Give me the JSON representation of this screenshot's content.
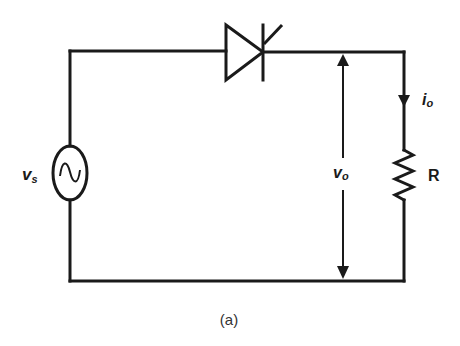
{
  "diagram": {
    "type": "circuit",
    "caption": "(a)",
    "components": {
      "source": {
        "name": "ac-voltage-source",
        "label_main": "v",
        "label_sub": "s",
        "symbol": "~"
      },
      "switch": {
        "name": "thyristor",
        "label": ""
      },
      "load": {
        "name": "resistor",
        "label": "R"
      }
    },
    "annotations": {
      "output_voltage": {
        "label_main": "v",
        "label_sub": "o"
      },
      "output_current": {
        "label_main": "i",
        "label_sub": "o"
      }
    },
    "colors": {
      "line": "#1a1a1a",
      "background": "#ffffff",
      "caption": "#333333"
    }
  }
}
